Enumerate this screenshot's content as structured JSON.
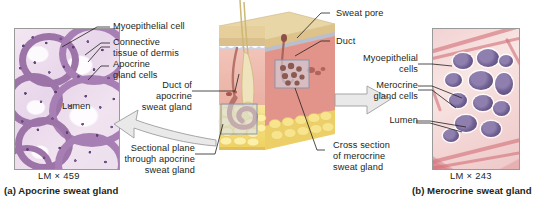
{
  "figure": {
    "type": "anatomy-histology-figure"
  },
  "panel_a": {
    "id": "panel-a",
    "caption": "(a) Apocrine sweat gland",
    "magnification": "LM × 459",
    "micrograph_name": "apocrine-sweat-gland-micrograph",
    "labels": [
      {
        "text": "Myoepithelial cell",
        "align": "left"
      },
      {
        "text": "Connective\ntissue of dermis",
        "align": "left"
      },
      {
        "text": "Apocrine\ngland cells",
        "align": "left"
      },
      {
        "text": "Lumen",
        "align": "left"
      }
    ],
    "label_myoepithelial": "Myoepithelial cell",
    "label_connective": "Connective\ntissue of dermis",
    "label_apocrine_cells": "Apocrine\ngland cells",
    "label_lumen": "Lumen",
    "colors": {
      "stain_light": "#f1e3f0",
      "stain_mid": "#e8d6ea",
      "epithelium": "#9c74a8",
      "nuclei": "#5d3e72"
    }
  },
  "panel_b": {
    "id": "panel-b",
    "caption": "(b) Merocrine sweat gland",
    "magnification": "LM × 243",
    "micrograph_name": "merocrine-sweat-gland-micrograph",
    "label_myoepithelial": "Myoepithelial\ncells",
    "label_merocrine_cells": "Merocrine\ngland cells",
    "label_lumen": "Lumen",
    "colors": {
      "connective_tissue": "#d4767e",
      "background": "#f3d6d5",
      "gland_cells": "#6f5f92"
    }
  },
  "center_diagram": {
    "name": "skin-block-diagram",
    "label_sweat_pore": "Sweat pore",
    "label_duct": "Duct",
    "label_duct_apocrine": "Duct of\napocrine\nsweat gland",
    "label_sectional_plane": "Sectional plane\nthrough apocrine\nsweat gland",
    "label_cross_section": "Cross section\nof merocrine\nsweat gland",
    "colors": {
      "epidermis": "#e3c68e",
      "epidermis_top": "#ead9b0",
      "dermis": "#efb8ad",
      "dermis_side": "#e08f80",
      "hypodermis_fat": "#f5de79",
      "duct": "#b5736a",
      "hair": "#d8c98c",
      "inset_border": "#8a93a8",
      "arrow_fill": "#e8e8e8",
      "arrow_stroke": "#9a9a9a"
    },
    "arrows": [
      {
        "name": "arrow-to-apocrine-micrograph",
        "direction": "left"
      },
      {
        "name": "arrow-to-merocrine-micrograph",
        "direction": "right"
      }
    ]
  }
}
